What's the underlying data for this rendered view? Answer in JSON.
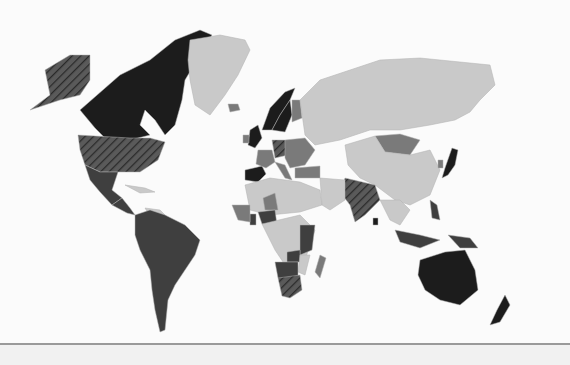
{
  "map": {
    "type": "choropleth",
    "projection": "world",
    "legend": [],
    "palette": {
      "ocean": "#fbfbfb",
      "black": "#1c1c1c",
      "dark": "#3f3f3f",
      "mid": "#7a7a7a",
      "light": "#c9c9c9",
      "hatch_bg": "#5a5a5a",
      "hatch_line": "#2a2a2a",
      "border": "#b0b0b0"
    },
    "regions": [
      {
        "name": "Canada",
        "shade": "black"
      },
      {
        "name": "Alaska",
        "shade": "hatched"
      },
      {
        "name": "United States",
        "shade": "hatched"
      },
      {
        "name": "Mexico",
        "shade": "dark"
      },
      {
        "name": "Central America",
        "shade": "dark"
      },
      {
        "name": "Caribbean",
        "shade": "light"
      },
      {
        "name": "Venezuela",
        "shade": "light"
      },
      {
        "name": "South America",
        "shade": "dark"
      },
      {
        "name": "Greenland",
        "shade": "light"
      },
      {
        "name": "Iceland",
        "shade": "mid"
      },
      {
        "name": "United Kingdom",
        "shade": "black"
      },
      {
        "name": "Ireland",
        "shade": "mid"
      },
      {
        "name": "Norway",
        "shade": "black"
      },
      {
        "name": "Sweden",
        "shade": "black"
      },
      {
        "name": "Finland",
        "shade": "mid"
      },
      {
        "name": "Spain",
        "shade": "black"
      },
      {
        "name": "France",
        "shade": "mid"
      },
      {
        "name": "Germany",
        "shade": "hatched"
      },
      {
        "name": "Central Europe",
        "shade": "mid"
      },
      {
        "name": "Italy",
        "shade": "mid"
      },
      {
        "name": "Turkey",
        "shade": "mid"
      },
      {
        "name": "Russia",
        "shade": "light"
      },
      {
        "name": "Mongolia",
        "shade": "mid"
      },
      {
        "name": "China",
        "shade": "light"
      },
      {
        "name": "Japan",
        "shade": "black"
      },
      {
        "name": "South Korea",
        "shade": "mid"
      },
      {
        "name": "India",
        "shade": "hatched"
      },
      {
        "name": "Sri Lanka",
        "shade": "black"
      },
      {
        "name": "Southeast Asia",
        "shade": "light"
      },
      {
        "name": "Indonesia",
        "shade": "dark"
      },
      {
        "name": "Philippines",
        "shade": "dark"
      },
      {
        "name": "Papua New Guinea",
        "shade": "dark"
      },
      {
        "name": "Australia",
        "shade": "black"
      },
      {
        "name": "New Zealand",
        "shade": "black"
      },
      {
        "name": "North Africa",
        "shade": "light"
      },
      {
        "name": "Middle East",
        "shade": "light"
      },
      {
        "name": "Niger",
        "shade": "mid"
      },
      {
        "name": "Nigeria",
        "shade": "dark"
      },
      {
        "name": "Ghana",
        "shade": "dark"
      },
      {
        "name": "West Africa",
        "shade": "mid"
      },
      {
        "name": "Central Africa",
        "shade": "light"
      },
      {
        "name": "Kenya/Tanzania",
        "shade": "dark"
      },
      {
        "name": "Zambia",
        "shade": "dark"
      },
      {
        "name": "Mozambique",
        "shade": "light"
      },
      {
        "name": "Madagascar",
        "shade": "mid"
      },
      {
        "name": "Namibia/Botswana",
        "shade": "dark"
      },
      {
        "name": "South Africa",
        "shade": "hatched"
      }
    ]
  }
}
